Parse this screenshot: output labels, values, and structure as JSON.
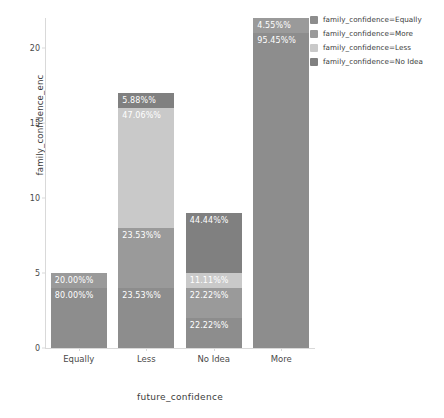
{
  "chart_data": {
    "type": "bar",
    "subtype": "stacked-bar",
    "title": "",
    "xlabel": "future_confidence",
    "ylabel": "family_confidence_enc",
    "categories": [
      "Equally",
      "Less",
      "No Idea",
      "More"
    ],
    "ylim": [
      0,
      22
    ],
    "yticks": [
      0,
      5,
      10,
      15,
      20
    ],
    "ytick_labels": [
      "0",
      "5",
      "10",
      "15",
      "20"
    ],
    "grid": false,
    "legend_position": "right",
    "series": [
      {
        "name": "family_confidence=Equally",
        "color": "#8d8d8d",
        "values": [
          4,
          4,
          2,
          21
        ],
        "labels": [
          "80.00%%",
          "23.53%%",
          "22.22%%",
          "95.45%%"
        ]
      },
      {
        "name": "family_confidence=More",
        "color": "#9a9a9a",
        "values": [
          1,
          4,
          2,
          1
        ],
        "labels": [
          "20.00%%",
          "23.53%%",
          "22.22%%",
          "4.55%%"
        ]
      },
      {
        "name": "family_confidence=Less",
        "color": "#c9c9c9",
        "values": [
          0,
          8,
          1,
          0
        ],
        "labels": [
          "",
          "47.06%%",
          "11.11%%",
          ""
        ]
      },
      {
        "name": "family_confidence=No Idea",
        "color": "#808080",
        "values": [
          0,
          1,
          4,
          0
        ],
        "labels": [
          "",
          "5.88%%",
          "44.44%%",
          ""
        ]
      }
    ],
    "bars": [
      {
        "category": "Equally",
        "total": 5,
        "segments": [
          {
            "series": "family_confidence=Equally",
            "value": 4,
            "label": "80.00%%",
            "color": "#8d8d8d",
            "label_color": "light"
          },
          {
            "series": "family_confidence=More",
            "value": 1,
            "label": "20.00%%",
            "color": "#9a9a9a",
            "label_color": "light"
          }
        ]
      },
      {
        "category": "Less",
        "total": 17,
        "segments": [
          {
            "series": "family_confidence=Equally",
            "value": 4,
            "label": "23.53%%",
            "color": "#8d8d8d",
            "label_color": "light"
          },
          {
            "series": "family_confidence=More",
            "value": 4,
            "label": "23.53%%",
            "color": "#9a9a9a",
            "label_color": "light"
          },
          {
            "series": "family_confidence=Less",
            "value": 8,
            "label": "47.06%%",
            "color": "#c9c9c9",
            "label_color": "light"
          },
          {
            "series": "family_confidence=No Idea",
            "value": 1,
            "label": "5.88%%",
            "color": "#808080",
            "label_color": "light"
          }
        ]
      },
      {
        "category": "No Idea",
        "total": 9,
        "segments": [
          {
            "series": "family_confidence=Equally",
            "value": 2,
            "label": "22.22%%",
            "color": "#8d8d8d",
            "label_color": "light"
          },
          {
            "series": "family_confidence=More",
            "value": 2,
            "label": "22.22%%",
            "color": "#9a9a9a",
            "label_color": "light"
          },
          {
            "series": "family_confidence=Less",
            "value": 1,
            "label": "11.11%%",
            "color": "#c9c9c9",
            "label_color": "light"
          },
          {
            "series": "family_confidence=No Idea",
            "value": 4,
            "label": "44.44%%",
            "color": "#808080",
            "label_color": "light"
          }
        ]
      },
      {
        "category": "More",
        "total": 22,
        "segments": [
          {
            "series": "family_confidence=Equally",
            "value": 21,
            "label": "95.45%%",
            "color": "#8d8d8d",
            "label_color": "light"
          },
          {
            "series": "family_confidence=More",
            "value": 1,
            "label": "4.55%%",
            "color": "#9a9a9a",
            "label_color": "light"
          }
        ]
      }
    ]
  },
  "legend": {
    "entries": [
      {
        "label": "family_confidence=Equally",
        "color": "#8d8d8d"
      },
      {
        "label": "family_confidence=More",
        "color": "#9a9a9a"
      },
      {
        "label": "family_confidence=Less",
        "color": "#c9c9c9"
      },
      {
        "label": "family_confidence=No Idea",
        "color": "#808080"
      }
    ]
  },
  "axes": {
    "y_title": "family_confidence_enc",
    "x_title": "future_confidence"
  }
}
